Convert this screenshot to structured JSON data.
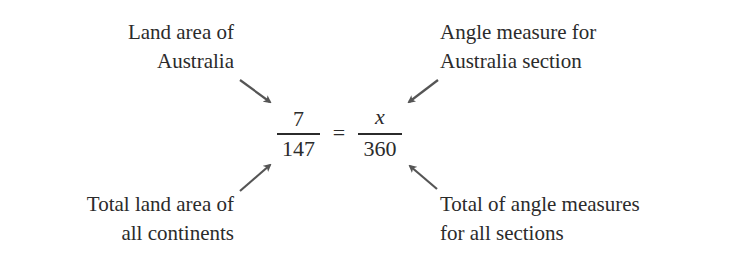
{
  "labels": {
    "top_left": [
      "Land area of",
      "Australia"
    ],
    "top_right": [
      "Angle measure for",
      "Australia section"
    ],
    "bottom_left": [
      "Total land area of",
      "all continents"
    ],
    "bottom_right": [
      "Total of angle measures",
      "for all sections"
    ]
  },
  "equation": {
    "left_numerator": "7",
    "left_denominator": "147",
    "equals": "=",
    "right_numerator": "x",
    "right_denominator": "360"
  },
  "colors": {
    "text": "#2b2b2b",
    "arrow": "#555555"
  }
}
